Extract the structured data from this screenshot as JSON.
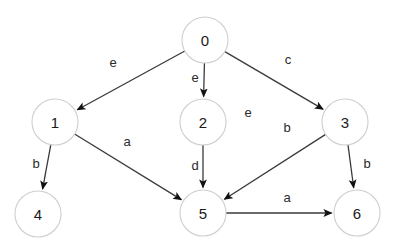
{
  "diagram": {
    "type": "directed-graph",
    "title": "",
    "canvas": {
      "width": 405,
      "height": 248,
      "background": "#ffffff"
    },
    "style": {
      "node_stroke": "#cfcfcf",
      "node_fill": "#ffffff",
      "edge_stroke": "#3a3a3a",
      "label_color": "#2a2a2a",
      "node_radius": 23
    },
    "nodes": [
      {
        "id": "0",
        "label": "0",
        "x": 205,
        "y": 40
      },
      {
        "id": "1",
        "label": "1",
        "x": 55,
        "y": 122
      },
      {
        "id": "2",
        "label": "2",
        "x": 203,
        "y": 122
      },
      {
        "id": "3",
        "label": "3",
        "x": 345,
        "y": 122
      },
      {
        "id": "4",
        "label": "4",
        "x": 38,
        "y": 214
      },
      {
        "id": "5",
        "label": "5",
        "x": 203,
        "y": 213
      },
      {
        "id": "6",
        "label": "6",
        "x": 357,
        "y": 213
      }
    ],
    "edges": [
      {
        "from": "0",
        "to": "1",
        "label": "e",
        "label_x": 113,
        "label_y": 62
      },
      {
        "from": "0",
        "to": "2",
        "label": "e",
        "label_x": 195,
        "label_y": 77
      },
      {
        "from": "0",
        "to": "3",
        "label": "c",
        "label_x": 288,
        "label_y": 59
      },
      {
        "from": "1",
        "to": "4",
        "label": "b",
        "label_x": 36,
        "label_y": 163
      },
      {
        "from": "1",
        "to": "5",
        "label": "a",
        "label_x": 127,
        "label_y": 141
      },
      {
        "from": "2",
        "to": "5",
        "label": "d",
        "label_x": 195,
        "label_y": 165
      },
      {
        "from": "3",
        "to": "5",
        "label": "b",
        "label_x": 287,
        "label_y": 127
      },
      {
        "from": "3",
        "to": "6",
        "label": "b",
        "label_x": 367,
        "label_y": 163
      },
      {
        "from": "5",
        "to": "6",
        "label": "a",
        "label_x": 287,
        "label_y": 197
      }
    ],
    "free_labels": [
      {
        "text": "e",
        "x": 248,
        "y": 112
      }
    ]
  }
}
